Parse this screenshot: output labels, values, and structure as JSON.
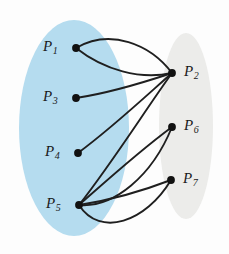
{
  "figure": {
    "type": "bipartite-like-multigraph-diagram",
    "background_color": "#fdfdfd",
    "edge_color": "#1f1f1f",
    "node_color": "#111111"
  },
  "regions": [
    {
      "id": "left-region",
      "name": "blue-ellipse-region",
      "fill": "#b5dcef",
      "cx": 74,
      "cy": 128,
      "rx": 55,
      "ry": 108
    },
    {
      "id": "right-region",
      "name": "gray-ellipse-region",
      "fill": "#ececea",
      "cx": 186,
      "cy": 126,
      "rx": 27,
      "ry": 93
    }
  ],
  "nodes": [
    {
      "id": "P1",
      "label": "P",
      "sub": "1",
      "x": 76,
      "y": 48,
      "label_x": 43,
      "label_y": 39,
      "region": "left-region"
    },
    {
      "id": "P3",
      "label": "P",
      "sub": "3",
      "x": 76,
      "y": 98,
      "label_x": 43,
      "label_y": 89,
      "region": "left-region"
    },
    {
      "id": "P4",
      "label": "P",
      "sub": "4",
      "x": 78,
      "y": 153,
      "label_x": 45,
      "label_y": 144,
      "region": "left-region"
    },
    {
      "id": "P5",
      "label": "P",
      "sub": "5",
      "x": 79,
      "y": 205,
      "label_x": 46,
      "label_y": 196,
      "region": "left-region"
    },
    {
      "id": "P2",
      "label": "P",
      "sub": "2",
      "x": 172,
      "y": 73,
      "label_x": 184,
      "label_y": 64,
      "region": "right-region"
    },
    {
      "id": "P6",
      "label": "P",
      "sub": "6",
      "x": 172,
      "y": 127,
      "label_x": 184,
      "label_y": 118,
      "region": "right-region"
    },
    {
      "id": "P7",
      "label": "P",
      "sub": "7",
      "x": 171,
      "y": 180,
      "label_x": 183,
      "label_y": 171,
      "region": "right-region"
    }
  ],
  "edges": [
    {
      "id": "e1",
      "from": "P1",
      "to": "P2",
      "multiplicity_index": 1,
      "path": "M 76 48 C 110 28 150 44 172 73"
    },
    {
      "id": "e2",
      "from": "P1",
      "to": "P2",
      "multiplicity_index": 2,
      "path": "M 76 48 C 104 70 140 80 172 73"
    },
    {
      "id": "e3",
      "from": "P3",
      "to": "P2",
      "multiplicity_index": 1,
      "path": "M 76 98 C 110 93 145 82 172 73"
    },
    {
      "id": "e4",
      "from": "P4",
      "to": "P2",
      "multiplicity_index": 1,
      "path": "M 78 153 C 112 128 146 96 172 73"
    },
    {
      "id": "e5",
      "from": "P5",
      "to": "P2",
      "multiplicity_index": 1,
      "path": "M 79 205 C 112 163 144 112 172 73"
    },
    {
      "id": "e6",
      "from": "P5",
      "to": "P6",
      "multiplicity_index": 1,
      "path": "M 79 205 C 104 183 138 152 172 127"
    },
    {
      "id": "e7",
      "from": "P5",
      "to": "P6",
      "multiplicity_index": 2,
      "path": "M 79 205 C 114 208 152 176 172 127"
    },
    {
      "id": "e8",
      "from": "P5",
      "to": "P7",
      "multiplicity_index": 1,
      "path": "M 79 205 C 112 200 145 190 171 180"
    },
    {
      "id": "e9",
      "from": "P5",
      "to": "P7",
      "multiplicity_index": 2,
      "path": "M 79 205 C 100 238 146 222 171 180"
    }
  ]
}
